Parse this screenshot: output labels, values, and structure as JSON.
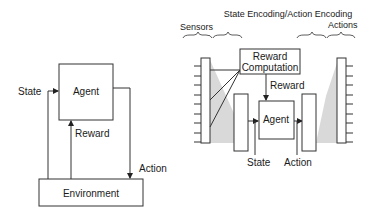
{
  "left_diagram": {
    "agent_label": "Agent",
    "environment_label": "Environment",
    "state_label": "State",
    "reward_label": "Reward",
    "action_label": "Action"
  },
  "right_diagram": {
    "title": "State Encoding/Action Encoding",
    "sensors_label": "Sensors",
    "actions_label": "Actions",
    "reward_computation_line1": "Reward",
    "reward_computation_line2": "Computation",
    "reward_label": "Reward",
    "agent_label": "Agent",
    "state_label": "State",
    "action_label": "Action",
    "sensor_tick_count": 10,
    "action_tick_count": 10
  },
  "colors": {
    "stroke": "#333333",
    "shade": "#d9d9d9",
    "text": "#1a1a1a"
  }
}
